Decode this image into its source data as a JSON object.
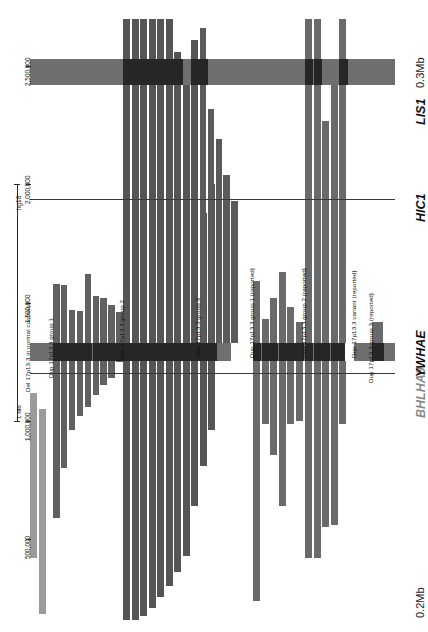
{
  "figure": {
    "type": "genomic-cnv-map",
    "assembly_label": "hg18",
    "orientation": "rotated-90"
  },
  "axis": {
    "title": "hg18",
    "scale_label": "1 Mb",
    "ticks": [
      {
        "label": "500,000",
        "value": 500000
      },
      {
        "label": "1,000,000",
        "value": 1000000
      },
      {
        "label": "1,500,000",
        "value": 1500000
      },
      {
        "label": "2,000,000",
        "value": 2000000
      },
      {
        "label": "2,500,000",
        "value": 2500000
      }
    ],
    "range": [
      150000,
      2720000
    ]
  },
  "genes": [
    {
      "name": "BHLHA9",
      "style": "gray",
      "has_line": true,
      "color": "#8a8a8a"
    },
    {
      "name": "YWHAE",
      "style": "black",
      "has_line": false,
      "color": "#111111"
    },
    {
      "name": "HIC1",
      "style": "black",
      "has_line": true,
      "color": "#111111"
    },
    {
      "name": "LIS1",
      "style": "black",
      "has_line": false,
      "color": "#111111"
    }
  ],
  "corner_labels": {
    "top_right": "0.3Mb",
    "bottom_right": "0.2Mb"
  },
  "colors": {
    "deletion_control": "#9a9a9a",
    "duplication_dark": "#595959",
    "duplication_mid": "#6d6d6d",
    "gene_band_dark": "#262626",
    "gene_band_light": "#6f6f6f",
    "reference_line": "#3a3a3a",
    "background": "#ffffff"
  },
  "groups": [
    {
      "id": "del-controls",
      "label": "Del 17p13.3 in normal controls",
      "color": "#9a9a9a",
      "n": 2
    },
    {
      "id": "dup-g1",
      "label": "Dup 17p13.3 group 1",
      "color": "#616161",
      "n": 9
    },
    {
      "id": "dup-g2",
      "label": "Dup 17p13.3 group 2",
      "color": "#555555",
      "n": 11
    },
    {
      "id": "dup-g3",
      "label": "Dup 17p13.3 group 3",
      "color": "#5a5a5a",
      "n": 5
    },
    {
      "id": "dup-g1-rep",
      "label": "Dup 17p13.3 group 1 (reported)",
      "color": "#6a6a6a",
      "n": 6
    },
    {
      "id": "dup-g2-rep",
      "label": "Dup 17p13.3 group 2 (reported)",
      "color": "#6a6a6a",
      "n": 5
    },
    {
      "id": "dup-variant-rep",
      "label": "Dup 17p13.3 variant (reported)",
      "color": "#6a6a6a",
      "n": 1
    },
    {
      "id": "dup-g3-rep",
      "label": "Dup 17p13.3 group 3 (reported)",
      "color": "#6a6a6a",
      "n": 1
    }
  ],
  "chart_data": {
    "type": "bar",
    "xlabel": "",
    "ylabel": "hg18 genomic coordinate",
    "ylim": [
      150000,
      2720000
    ],
    "grid": false,
    "legend": "inline-group-labels",
    "gene_bands": [
      {
        "name": "BHLHA9",
        "start": 1190000,
        "end": 1215000,
        "kind": "line"
      },
      {
        "name": "YWHAE",
        "start": 1252000,
        "end": 1330000,
        "kind": "band"
      },
      {
        "name": "HIC1",
        "start": 1930000,
        "end": 1950000,
        "kind": "line"
      },
      {
        "name": "LIS1",
        "start": 2420000,
        "end": 2530000,
        "kind": "band"
      }
    ],
    "samples": [
      {
        "group": "del-controls",
        "start": 420000,
        "end": 1120000
      },
      {
        "group": "del-controls",
        "start": 185000,
        "end": 1050000
      },
      {
        "group": "dup-g1",
        "start": 590000,
        "end": 1580000
      },
      {
        "group": "dup-g1",
        "start": 800000,
        "end": 1575000
      },
      {
        "group": "dup-g1",
        "start": 960000,
        "end": 1470000
      },
      {
        "group": "dup-g1",
        "start": 1020000,
        "end": 1465000
      },
      {
        "group": "dup-g1",
        "start": 1060000,
        "end": 1620000
      },
      {
        "group": "dup-g1",
        "start": 1110000,
        "end": 1530000
      },
      {
        "group": "dup-g1",
        "start": 1150000,
        "end": 1520000
      },
      {
        "group": "dup-g1",
        "start": 1180000,
        "end": 1490000
      },
      {
        "group": "dup-g1",
        "start": 1250000,
        "end": 1460000
      },
      {
        "group": "dup-g2",
        "start": 160000,
        "end": 2700000
      },
      {
        "group": "dup-g2",
        "start": 160000,
        "end": 2700000
      },
      {
        "group": "dup-g2",
        "start": 175000,
        "end": 2700000
      },
      {
        "group": "dup-g2",
        "start": 210000,
        "end": 2700000
      },
      {
        "group": "dup-g2",
        "start": 255000,
        "end": 2700000
      },
      {
        "group": "dup-g2",
        "start": 300000,
        "end": 2700000
      },
      {
        "group": "dup-g2",
        "start": 360000,
        "end": 2560000
      },
      {
        "group": "dup-g2",
        "start": 430000,
        "end": 2455000
      },
      {
        "group": "dup-g2",
        "start": 640000,
        "end": 2610000
      },
      {
        "group": "dup-g2",
        "start": 810000,
        "end": 1880000
      },
      {
        "group": "dup-g2",
        "start": 960000,
        "end": 2000000
      },
      {
        "group": "dup-g3",
        "start": 1275000,
        "end": 2660000
      },
      {
        "group": "dup-g3",
        "start": 1280000,
        "end": 2320000
      },
      {
        "group": "dup-g3",
        "start": 1282000,
        "end": 2190000
      },
      {
        "group": "dup-g3",
        "start": 1283000,
        "end": 2040000
      },
      {
        "group": "dup-g3",
        "start": 1284000,
        "end": 1930000
      },
      {
        "group": "dup-g1-rep",
        "start": 240000,
        "end": 1590000
      },
      {
        "group": "dup-g1-rep",
        "start": 985000,
        "end": 1430000
      },
      {
        "group": "dup-g1-rep",
        "start": 855000,
        "end": 1520000
      },
      {
        "group": "dup-g1-rep",
        "start": 640000,
        "end": 1630000
      },
      {
        "group": "dup-g1-rep",
        "start": 985000,
        "end": 1480000
      },
      {
        "group": "dup-g1-rep",
        "start": 1000000,
        "end": 1420000
      },
      {
        "group": "dup-g2-rep",
        "start": 420000,
        "end": 2700000
      },
      {
        "group": "dup-g2-rep",
        "start": 420000,
        "end": 2700000
      },
      {
        "group": "dup-g2-rep",
        "start": 550000,
        "end": 2270000
      },
      {
        "group": "dup-g2-rep",
        "start": 560000,
        "end": 2510000
      },
      {
        "group": "dup-g2-rep",
        "start": 985000,
        "end": 2700000
      },
      {
        "group": "dup-variant-rep",
        "start": 1262000,
        "end": 1320000
      },
      {
        "group": "dup-g3-rep",
        "start": 1252000,
        "end": 1420000
      }
    ]
  }
}
